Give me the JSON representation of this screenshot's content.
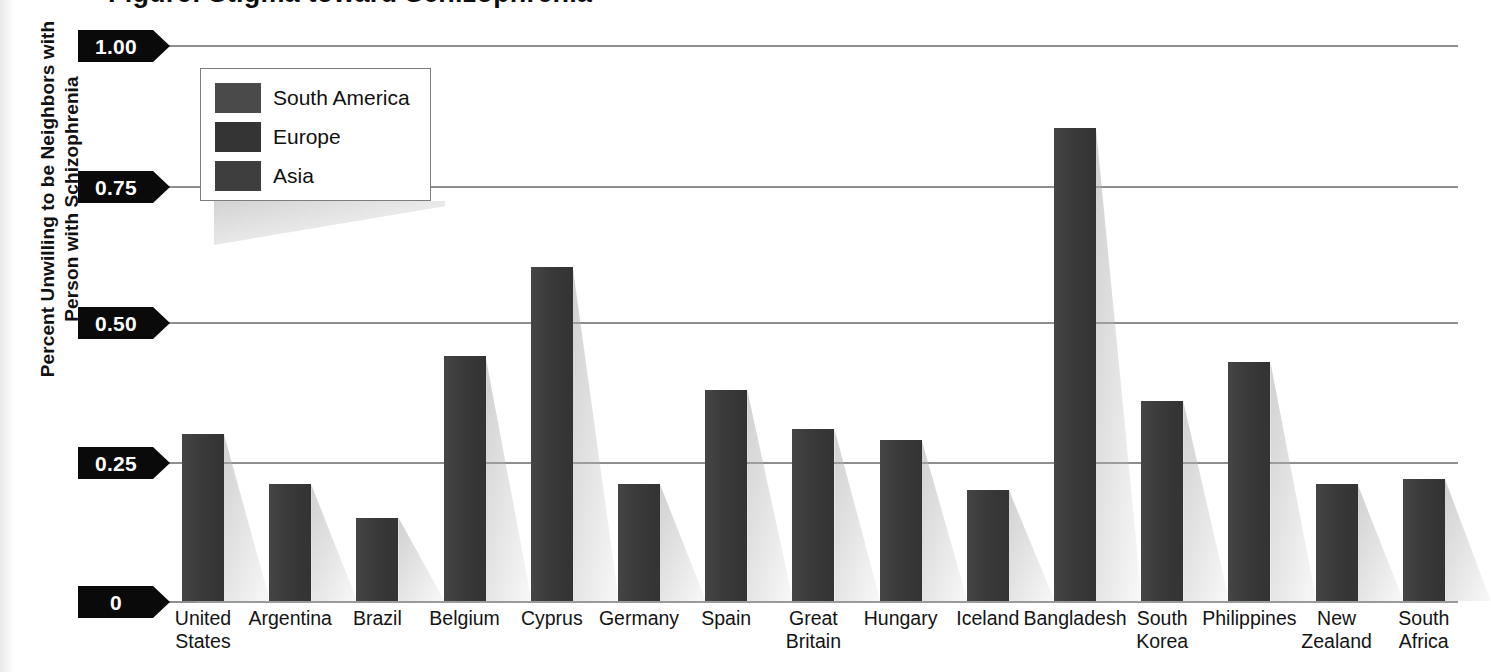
{
  "chart_data": {
    "type": "bar",
    "title": "",
    "xlabel": "",
    "ylabel": "Percent Unwilling to be Neighbors with Person with Schizophrenia",
    "ylabel_lines": [
      "Percent Unwilling to be Neighbors with",
      "Person with Schizophrenia"
    ],
    "ylim": [
      0,
      1.0
    ],
    "ytick_labels": [
      "1.00",
      "0.75",
      "0.50",
      "0.25",
      "0"
    ],
    "ytick_values": [
      1.0,
      0.75,
      0.5,
      0.25,
      0
    ],
    "grid": true,
    "legend_position": "upper-left-inside",
    "categories": [
      "United States",
      "Argentina",
      "Brazil",
      "Belgium",
      "Cyprus",
      "Germany",
      "Spain",
      "Great Britain",
      "Hungary",
      "Iceland",
      "Bangladesh",
      "South Korea",
      "Philippines",
      "New Zealand",
      "South Africa"
    ],
    "category_lines": [
      [
        "United",
        "States"
      ],
      [
        "Argentina"
      ],
      [
        "Brazil"
      ],
      [
        "Belgium"
      ],
      [
        "Cyprus"
      ],
      [
        "Germany"
      ],
      [
        "Spain"
      ],
      [
        "Great",
        "Britain"
      ],
      [
        "Hungary"
      ],
      [
        "Iceland"
      ],
      [
        "Bangladesh"
      ],
      [
        "South",
        "Korea"
      ],
      [
        "Philippines"
      ],
      [
        "New",
        "Zealand"
      ],
      [
        "South",
        "Africa"
      ]
    ],
    "values": [
      0.3,
      0.21,
      0.15,
      0.44,
      0.6,
      0.21,
      0.38,
      0.31,
      0.29,
      0.2,
      0.85,
      0.36,
      0.43,
      0.21,
      0.22
    ],
    "region_of_category": [
      "North America",
      "South America",
      "South America",
      "Europe",
      "Europe",
      "Europe",
      "Europe",
      "Europe",
      "Europe",
      "Europe",
      "Asia",
      "Asia",
      "Asia",
      "Oceania",
      "Africa"
    ],
    "bar_color": "#3b3b3b",
    "gridline_color": "#8e8e8e",
    "tick_flag_color": "#0a0a0a",
    "legend": [
      {
        "label": "South America",
        "color": "#4a4a4a"
      },
      {
        "label": "Europe",
        "color": "#343434"
      },
      {
        "label": "Asia",
        "color": "#3e3e3e"
      }
    ]
  },
  "cropped_title_fragment": "Figure: Stigma toward Schizophrenia"
}
